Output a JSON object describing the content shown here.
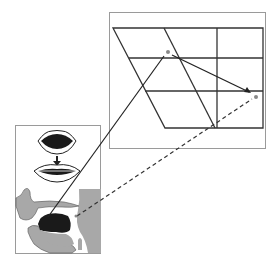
{
  "diagram": {
    "colors": {
      "background": "#ffffff",
      "box_border": "#9a9a9a",
      "grid_line": "#333333",
      "tissue_gray": "#a8a8a8",
      "tongue_black": "#1a1a1a",
      "point_marker": "#888888"
    },
    "vowel_chart": {
      "label": "vowel-quadrilateral",
      "points": [
        {
          "name": "vowel-point-1",
          "x": 168,
          "y": 52
        },
        {
          "name": "vowel-point-2",
          "x": 256,
          "y": 97
        }
      ]
    },
    "articulation_panel": {
      "elements": [
        "open-lips",
        "arrow-down",
        "spread-lips",
        "vocal-tract-sagittal-view"
      ]
    },
    "connectors": [
      {
        "name": "solid-connector",
        "style": "solid"
      },
      {
        "name": "dashed-connector",
        "style": "dashed"
      },
      {
        "name": "chart-transition-arrow",
        "style": "solid"
      }
    ]
  }
}
